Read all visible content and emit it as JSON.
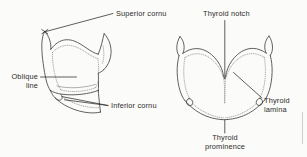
{
  "figure": {
    "background_color": "#fbfbf9",
    "ink_color": "#3a3a3a",
    "text_color": "#2b2b2b",
    "views": [
      {
        "name": "lateral-view",
        "position": "left"
      },
      {
        "name": "anterior-view",
        "position": "right"
      }
    ]
  },
  "labels": {
    "superior_cornu": "Superior cornu",
    "oblique_line_1": "Oblique",
    "oblique_line_2": "line",
    "inferior_cornu": "Inferior cornu",
    "thyroid_notch": "Thyroid notch",
    "thyroid_lamina_1": "Thyroid",
    "thyroid_lamina_2": "lamina",
    "thyroid_prominence_1": "Thyroid",
    "thyroid_prominence_2": "prominence"
  }
}
